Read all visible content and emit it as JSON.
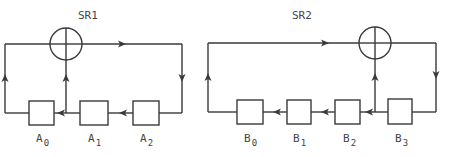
{
  "diagram": {
    "type": "shift-register-feedback",
    "registers": [
      {
        "title": "SR1",
        "cells": [
          {
            "name": "A",
            "index": "0"
          },
          {
            "name": "A",
            "index": "1"
          },
          {
            "name": "A",
            "index": "2"
          }
        ],
        "xor_inputs": [
          "A0 output",
          "A1 output"
        ],
        "feedback_to": "A2"
      },
      {
        "title": "SR2",
        "cells": [
          {
            "name": "B",
            "index": "0"
          },
          {
            "name": "B",
            "index": "1"
          },
          {
            "name": "B",
            "index": "2"
          },
          {
            "name": "B",
            "index": "3"
          }
        ],
        "xor_inputs": [
          "B0 output",
          "B3 output"
        ],
        "feedback_to": "B3"
      }
    ],
    "colors": {
      "line": "#3a3a3a",
      "text": "#444444",
      "background": "#ffffff"
    }
  }
}
